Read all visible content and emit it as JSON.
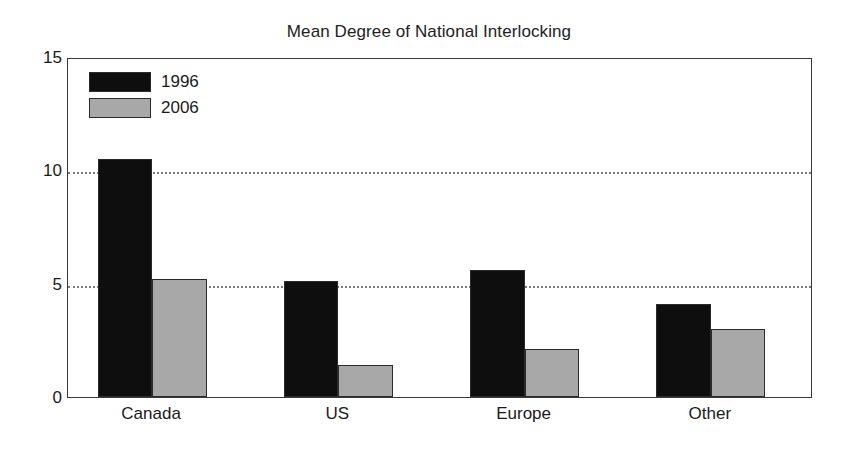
{
  "chart_data": {
    "type": "bar",
    "title": "Mean Degree of National Interlocking",
    "xlabel": "",
    "ylabel": "",
    "categories": [
      "Canada",
      "US",
      "Europe",
      "Other"
    ],
    "series": [
      {
        "name": "1996",
        "color": "#0e0e0e",
        "values": [
          10.5,
          5.1,
          5.6,
          4.1
        ]
      },
      {
        "name": "2006",
        "color": "#a8a8a8",
        "values": [
          5.2,
          1.4,
          2.1,
          3.0
        ]
      }
    ],
    "ylim": [
      0,
      15
    ],
    "yticks": [
      0,
      5,
      10,
      15
    ],
    "ytick_labels": [
      "0",
      "5",
      "10",
      "15"
    ],
    "gridlines": [
      5,
      10
    ],
    "grid": "horizontal-dotted",
    "legend_position": "top-left-inside",
    "background": "#ffffff",
    "frame_color": "#3a3a3a"
  }
}
